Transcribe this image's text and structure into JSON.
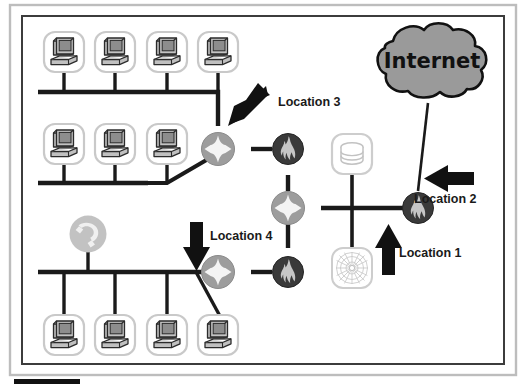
{
  "diagram": {
    "type": "network-topology",
    "frame": {
      "outer_border_color": "#b9b9b9",
      "inner_border_color": "#3c3c3c",
      "background": "#ffffff"
    },
    "colors": {
      "link": "#1a1a1a",
      "router_fill": "#9d9d9d",
      "router_glyph": "#f2f2f2",
      "firewall_fill": "#3a3a3a",
      "firewall_glyph": "#c8c8c8",
      "cloud_fill": "#9a9a9a",
      "cloud_stroke": "#111111",
      "icon_box_stroke": "#c9c9c9",
      "computer_body": "#b8b8b8",
      "computer_screen": "#8f8f8f",
      "computer_stroke": "#2b2b2b",
      "arrow": "#111111",
      "label_text": "#1a1a1a",
      "phone_fill": "#bdbdbd"
    },
    "cloud": {
      "label": "Internet",
      "name": "internet-cloud"
    },
    "annotations": [
      {
        "id": "loc1",
        "label": "Location 1",
        "arrow_direction": "up",
        "points_at": "edge-firewall"
      },
      {
        "id": "loc2",
        "label": "Location 2",
        "arrow_direction": "left",
        "points_at": "edge-firewall"
      },
      {
        "id": "loc3",
        "label": "Location 3",
        "arrow_direction": "down-left",
        "points_at": "upper-branch-router"
      },
      {
        "id": "loc4",
        "label": "Location 4",
        "arrow_direction": "down",
        "points_at": "lower-branch-router"
      }
    ],
    "nodes": [
      {
        "id": "pc-top-1",
        "type": "computer",
        "name": "workstation-icon"
      },
      {
        "id": "pc-top-2",
        "type": "computer",
        "name": "workstation-icon"
      },
      {
        "id": "pc-top-3",
        "type": "computer",
        "name": "workstation-icon"
      },
      {
        "id": "pc-top-4",
        "type": "computer",
        "name": "workstation-icon"
      },
      {
        "id": "pc-mid-1",
        "type": "computer",
        "name": "workstation-icon"
      },
      {
        "id": "pc-mid-2",
        "type": "computer",
        "name": "workstation-icon"
      },
      {
        "id": "pc-mid-3",
        "type": "computer",
        "name": "workstation-icon"
      },
      {
        "id": "pc-bot-1",
        "type": "computer",
        "name": "workstation-icon"
      },
      {
        "id": "pc-bot-2",
        "type": "computer",
        "name": "workstation-icon"
      },
      {
        "id": "pc-bot-3",
        "type": "computer",
        "name": "workstation-icon"
      },
      {
        "id": "pc-bot-4",
        "type": "computer",
        "name": "workstation-icon"
      },
      {
        "id": "phone",
        "type": "phone",
        "name": "telephone-icon"
      },
      {
        "id": "router-upper",
        "type": "router",
        "name": "router-icon"
      },
      {
        "id": "router-core",
        "type": "router",
        "name": "router-icon"
      },
      {
        "id": "router-lower",
        "type": "router",
        "name": "router-icon"
      },
      {
        "id": "firewall-upper",
        "type": "firewall",
        "name": "firewall-icon"
      },
      {
        "id": "firewall-lower",
        "type": "firewall",
        "name": "firewall-icon"
      },
      {
        "id": "firewall-edge",
        "type": "firewall",
        "name": "firewall-icon"
      },
      {
        "id": "database",
        "type": "database",
        "name": "database-icon"
      },
      {
        "id": "webserver",
        "type": "web",
        "name": "web-server-icon"
      }
    ],
    "bottom_bar": {
      "name": "bottom-black-bar",
      "color": "#111111"
    }
  }
}
